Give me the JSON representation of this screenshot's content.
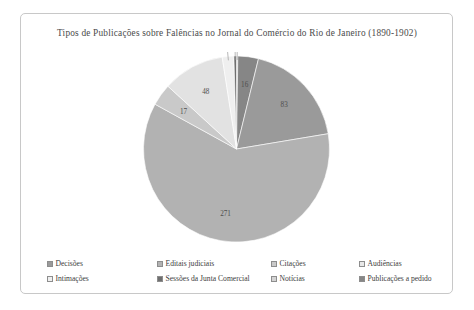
{
  "chart_data": {
    "type": "pie",
    "title": "Tipos de Publicações sobre Falências no Jornal do Comércio do Rio de Janeiro (1890-1902)",
    "categories": [
      "Decisões",
      "Editais judiciais",
      "Citações",
      "Audiências",
      "Intimações",
      "Sessões da Junta Comercial",
      "Notícias",
      "Publicações a pedido"
    ],
    "values": [
      83,
      271,
      17,
      48,
      9,
      2,
      1,
      16
    ],
    "labels": [
      "83",
      "271",
      "17",
      "48",
      "9",
      "2",
      "1",
      "16"
    ],
    "colors": [
      "#9a9a9a",
      "#b2b2b2",
      "#c9c9c9",
      "#e2e2e2",
      "#efefef",
      "#6f6f6f",
      "#d4d4d4",
      "#868686"
    ],
    "total": 447,
    "legend_position": "bottom",
    "grid": false,
    "xlabel": "",
    "ylabel": ""
  },
  "legend": {
    "row1": [
      {
        "label": "Decisões",
        "color": "#9a9a9a"
      },
      {
        "label": "Editais judiciais",
        "color": "#b2b2b2"
      },
      {
        "label": "Citações",
        "color": "#c9c9c9"
      },
      {
        "label": "Audiências",
        "color": "#e8e8e8"
      }
    ],
    "row2": [
      {
        "label": "Intimações",
        "color": "#efefef"
      },
      {
        "label": "Sessões da Junta Comercial",
        "color": "#6f6f6f"
      },
      {
        "label": "Notícias",
        "color": "#d4d4d4"
      },
      {
        "label": "Publicações a pedido",
        "color": "#868686"
      }
    ]
  }
}
